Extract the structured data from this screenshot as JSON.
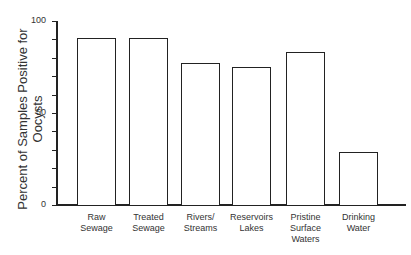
{
  "chart_data": {
    "type": "bar",
    "title": "",
    "xlabel": "",
    "ylabel": "Percent of Samples Positive for Oocysts",
    "ylim": [
      0,
      100
    ],
    "yticks": [
      0,
      50,
      100
    ],
    "grid": false,
    "categories": [
      "Raw\nSewage",
      "Treated\nSewage",
      "Rivers/\nStreams",
      "Reservoirs\nLakes",
      "Pristine\nSurface\nWaters",
      "Drinking\nWater"
    ],
    "values": [
      91,
      91,
      77,
      75,
      83,
      29
    ]
  }
}
